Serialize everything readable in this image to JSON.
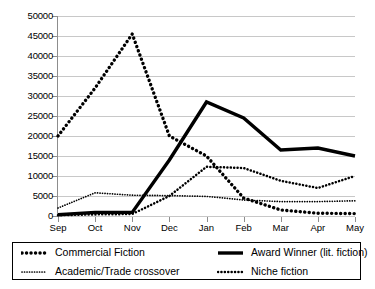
{
  "chart_data": {
    "type": "line",
    "title": "",
    "subtitle": "",
    "xlabel": "",
    "ylabel": "",
    "categories": [
      "Sep",
      "Oct",
      "Nov",
      "Dec",
      "Jan",
      "Feb",
      "Mar",
      "Apr",
      "May"
    ],
    "ylim": [
      0,
      50000
    ],
    "ytick_values": [
      0,
      5000,
      10000,
      15000,
      20000,
      25000,
      30000,
      35000,
      40000,
      45000,
      50000
    ],
    "ytick_labels": [
      "0",
      "5000",
      "10000",
      "15000",
      "20000",
      "25000",
      "30000",
      "35000",
      "40000",
      "45000",
      "50000"
    ],
    "grid": true,
    "legend_position": "bottom",
    "series": [
      {
        "name": "Commercial Fiction",
        "style": "dotted-thick",
        "color": "#000000",
        "values": [
          20000,
          32000,
          45500,
          20000,
          15000,
          4500,
          1500,
          700,
          600
        ]
      },
      {
        "name": "Award Winner (lit. fiction)",
        "style": "solid-thick",
        "color": "#000000",
        "values": [
          300,
          900,
          900,
          14000,
          28500,
          24500,
          16500,
          17000,
          15000
        ]
      },
      {
        "name": "Academic/Trade crossover",
        "style": "dotted-fine",
        "color": "#000000",
        "values": [
          2000,
          5800,
          5200,
          5100,
          4900,
          4000,
          3600,
          3600,
          3800
        ]
      },
      {
        "name": "Niche fiction",
        "style": "dotted-medium",
        "color": "#000000",
        "values": [
          200,
          400,
          500,
          5000,
          12300,
          12000,
          8800,
          7000,
          10000
        ]
      }
    ]
  },
  "legend": {
    "entries": [
      {
        "label": "Commercial Fiction",
        "marker": "dotted-thick-marker"
      },
      {
        "label": "Award Winner (lit. fiction)",
        "marker": "solid-thick-marker"
      },
      {
        "label": "Academic/Trade crossover",
        "marker": "dotted-fine-marker"
      },
      {
        "label": "Niche fiction",
        "marker": "dotted-medium-marker"
      }
    ]
  },
  "colors": {
    "series": "#000000",
    "gridline": "#c8c8c8",
    "axis": "#8d8d8d",
    "background": "#ffffff"
  }
}
